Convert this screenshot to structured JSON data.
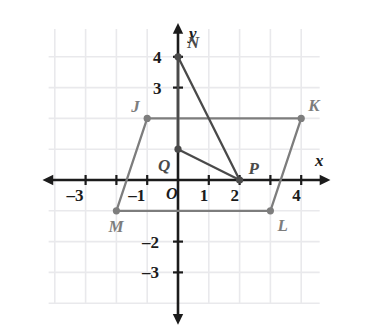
{
  "figure": {
    "kind": "coordinate-plane-geometry",
    "background_color": "#ffffff",
    "grid_color": "#e9e9ec",
    "axis_color": "#1b1b1b",
    "shape_color": "#7d7d7d",
    "triangle_color": "#4a4a4a"
  },
  "axes": {
    "x_label": "x",
    "y_label": "y",
    "origin_label": "O",
    "x_ticks": [
      {
        "value": -3,
        "label": "-3"
      },
      {
        "value": -2,
        "label": ""
      },
      {
        "value": -1,
        "label": "-1"
      },
      {
        "value": 1,
        "label": "1"
      },
      {
        "value": 2,
        "label": "2"
      },
      {
        "value": 3,
        "label": ""
      },
      {
        "value": 4,
        "label": "4"
      }
    ],
    "y_ticks": [
      {
        "value": 4,
        "label": "4"
      },
      {
        "value": 3,
        "label": "3"
      },
      {
        "value": 2,
        "label": ""
      },
      {
        "value": 1,
        "label": ""
      },
      {
        "value": -1,
        "label": ""
      },
      {
        "value": -2,
        "label": "-2"
      },
      {
        "value": -3,
        "label": "-3"
      }
    ]
  },
  "chart_data": {
    "type": "scatter",
    "title": "",
    "xlabel": "x",
    "ylabel": "y",
    "xlim": [
      -4,
      5
    ],
    "ylim": [
      -4,
      5
    ],
    "grid": true,
    "legend": "none",
    "x_ticks": [
      -3,
      -2,
      -1,
      1,
      2,
      3,
      4
    ],
    "y_ticks": [
      4,
      3,
      2,
      1,
      -1,
      -2,
      -3
    ],
    "x_tick_labels": [
      "-3",
      "",
      "-1",
      "1",
      "2",
      "",
      "4"
    ],
    "y_tick_labels": [
      "4",
      "3",
      "",
      "",
      "",
      "-2",
      "-3"
    ],
    "points": [
      {
        "name": "J",
        "x": -1,
        "y": 2,
        "label": "J",
        "label_dx": -16,
        "label_dy": -20
      },
      {
        "name": "K",
        "x": 4,
        "y": 2,
        "label": "K",
        "label_dx": 7,
        "label_dy": -21
      },
      {
        "name": "L",
        "x": 3,
        "y": -1,
        "label": "L",
        "label_dx": 7,
        "label_dy": 6
      },
      {
        "name": "M",
        "x": -2,
        "y": -1,
        "label": "M",
        "label_dx": -8,
        "label_dy": 7
      },
      {
        "name": "N",
        "x": 0,
        "y": 4,
        "label": "N",
        "label_dx": 9,
        "label_dy": -23
      },
      {
        "name": "P",
        "x": 2,
        "y": 0,
        "label": "P",
        "label_dx": 9,
        "label_dy": -20
      },
      {
        "name": "Q",
        "x": 0,
        "y": 1,
        "label": "Q",
        "label_dx": -20,
        "label_dy": 8
      }
    ],
    "polygons": [
      {
        "name": "parallelogram-JKLM",
        "vertices": [
          "J",
          "K",
          "L",
          "M"
        ],
        "closed": true,
        "color": "#7d7d7d",
        "fill": "none"
      },
      {
        "name": "triangle-NPQ",
        "vertices": [
          "N",
          "P",
          "Q"
        ],
        "closed": true,
        "color": "#4a4a4a",
        "fill": "none"
      }
    ],
    "annotations": [
      "Parallelogram J K L M with vertices J(-1,2), K(4,2), L(3,-1), M(-2,-1)",
      "Triangle N P Q with vertices N(0,4), P(2,0), Q(0,1)"
    ]
  }
}
